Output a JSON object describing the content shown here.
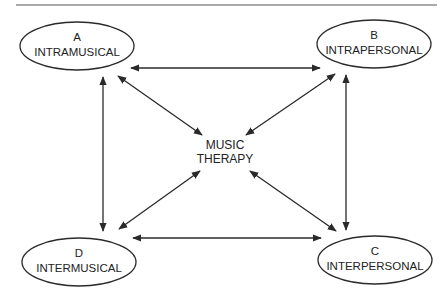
{
  "diagram": {
    "title": "",
    "center": {
      "line1": "MUSIC",
      "line2": "THERAPY"
    },
    "nodes": [
      {
        "id": "A",
        "letter": "A",
        "label": "INTRAMUSICAL"
      },
      {
        "id": "B",
        "letter": "B",
        "label": "INTRAPERSONAL"
      },
      {
        "id": "C",
        "letter": "C",
        "label": "INTERPERSONAL"
      },
      {
        "id": "D",
        "letter": "D",
        "label": "INTERMUSICAL"
      }
    ],
    "edges": [
      {
        "from": "A",
        "to": "B",
        "type": "bidirectional"
      },
      {
        "from": "A",
        "to": "D",
        "type": "bidirectional"
      },
      {
        "from": "B",
        "to": "C",
        "type": "bidirectional"
      },
      {
        "from": "D",
        "to": "C",
        "type": "bidirectional"
      },
      {
        "from": "A",
        "to": "MUSIC THERAPY",
        "type": "bidirectional"
      },
      {
        "from": "B",
        "to": "MUSIC THERAPY",
        "type": "bidirectional"
      },
      {
        "from": "C",
        "to": "MUSIC THERAPY",
        "type": "bidirectional"
      },
      {
        "from": "D",
        "to": "MUSIC THERAPY",
        "type": "bidirectional"
      }
    ],
    "colors": {
      "stroke": "#2a2a2a",
      "text": "#222222",
      "background": "#ffffff"
    }
  }
}
